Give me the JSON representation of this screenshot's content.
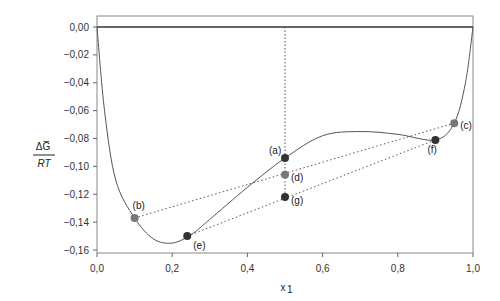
{
  "chart_data": {
    "type": "line",
    "title": "",
    "xlabel": "x1",
    "ylabel": "ΔG/RT",
    "xlim": [
      0,
      1
    ],
    "ylim": [
      -0.16,
      0.005
    ],
    "x_ticks": [
      "0,0",
      "0,2",
      "0,4",
      "0,6",
      "0,8",
      "1,0"
    ],
    "y_ticks": [
      "0,00",
      "-0,02",
      "-0,04",
      "-0,06",
      "-0,08",
      "-0,10",
      "-0,12",
      "-0,14",
      "-0,16"
    ],
    "grid": false,
    "series": [
      {
        "name": "ΔG/RT curve",
        "x": [
          0,
          0.02,
          0.05,
          0.1,
          0.15,
          0.2,
          0.25,
          0.3,
          0.4,
          0.5,
          0.6,
          0.7,
          0.8,
          0.9,
          0.95,
          0.98,
          1.0
        ],
        "values": [
          0,
          -0.06,
          -0.11,
          -0.137,
          -0.152,
          -0.155,
          -0.149,
          -0.138,
          -0.115,
          -0.094,
          -0.078,
          -0.075,
          -0.077,
          -0.081,
          -0.069,
          -0.04,
          0
        ]
      }
    ],
    "points": [
      {
        "label": "(a)",
        "x": 0.5,
        "y": -0.094,
        "color": "#333333"
      },
      {
        "label": "(b)",
        "x": 0.1,
        "y": -0.137,
        "color": "#777777"
      },
      {
        "label": "(c)",
        "x": 0.95,
        "y": -0.069,
        "color": "#777777"
      },
      {
        "label": "(d)",
        "x": 0.5,
        "y": -0.106,
        "color": "#777777"
      },
      {
        "label": "(e)",
        "x": 0.24,
        "y": -0.15,
        "color": "#333333"
      },
      {
        "label": "(f)",
        "x": 0.9,
        "y": -0.081,
        "color": "#333333"
      },
      {
        "label": "(g)",
        "x": 0.5,
        "y": -0.122,
        "color": "#333333"
      }
    ],
    "annotations": [
      "dotted tie-line (b)-(c)",
      "dotted tie-line (e)-(f)",
      "vertical dotted line at x1=0.5"
    ]
  }
}
